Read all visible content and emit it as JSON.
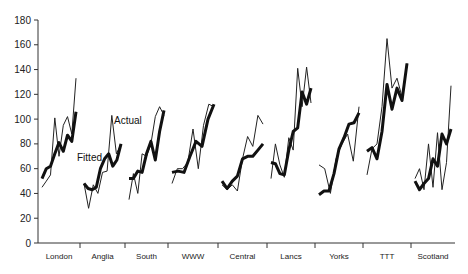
{
  "chart_data": {
    "type": "line",
    "title": "",
    "xlabel": "",
    "ylabel": "",
    "ylim": [
      0,
      180
    ],
    "yticks": [
      0,
      20,
      40,
      60,
      80,
      100,
      120,
      140,
      160,
      180
    ],
    "grid": false,
    "legend": "inline annotations",
    "categories": [
      "London",
      "Anglia",
      "South",
      "WWW",
      "Central",
      "Lancs",
      "Yorks",
      "TTT",
      "Scotland"
    ],
    "annotations": [
      {
        "text": "Actual",
        "region": "Anglia",
        "value": 100
      },
      {
        "text": "Fitted",
        "region": "Anglia",
        "value": 69
      }
    ],
    "series": [
      {
        "name": "Actual",
        "style": "thin",
        "regions": {
          "London": [
            45,
            50,
            55,
            101,
            70,
            95,
            102,
            88,
            133
          ],
          "Anglia": [
            48,
            28,
            47,
            40,
            57,
            58,
            103,
            72,
            80
          ],
          "South": [
            35,
            56,
            40,
            72,
            70,
            80,
            102,
            110,
            103
          ],
          "WWW": [
            48,
            60,
            60,
            65,
            92,
            60,
            95,
            112,
            110
          ],
          "Central": [
            47,
            43,
            47,
            42,
            68,
            86,
            78,
            103,
            96
          ],
          "Lancs": [
            52,
            80,
            63,
            53,
            85,
            75,
            141,
            110,
            142,
            113
          ],
          "Yorks": [
            63,
            60,
            40,
            68,
            80,
            88,
            66,
            110
          ],
          "TTT": [
            55,
            76,
            80,
            110,
            165,
            125,
            133,
            118,
            145
          ],
          "Scotland": [
            52,
            60,
            43,
            80,
            45,
            89,
            43,
            65,
            127
          ]
        }
      },
      {
        "name": "Fitted",
        "style": "thick",
        "regions": {
          "London": [
            52,
            60,
            62,
            72,
            81,
            74,
            87,
            82,
            106
          ],
          "Anglia": [
            48,
            44,
            43,
            45,
            60,
            68,
            72,
            62,
            67,
            80
          ],
          "South": [
            52,
            52,
            58,
            57,
            72,
            82,
            67,
            90,
            107
          ],
          "WWW": [
            57,
            58,
            57,
            70,
            82,
            78,
            100,
            112
          ],
          "Central": [
            50,
            44,
            50,
            54,
            68,
            70,
            70,
            75,
            80
          ],
          "Lancs": [
            65,
            64,
            56,
            55,
            75,
            90,
            93,
            122,
            112,
            125
          ],
          "Yorks": [
            39,
            42,
            42,
            56,
            76,
            85,
            96,
            97,
            105
          ],
          "TTT": [
            74,
            77,
            68,
            90,
            128,
            108,
            125,
            115,
            145
          ],
          "Scotland": [
            50,
            43,
            48,
            52,
            68,
            62,
            88,
            80,
            92
          ]
        }
      }
    ]
  },
  "axis": {
    "y_ticks": [
      "0",
      "20",
      "40",
      "60",
      "80",
      "100",
      "120",
      "140",
      "160",
      "180"
    ],
    "x_labels": [
      "London",
      "Anglia",
      "South",
      "WWW",
      "Central",
      "Lancs",
      "Yorks",
      "TTT",
      "Scotland"
    ]
  },
  "labels": {
    "actual": "Actual",
    "fitted": "Fitted"
  }
}
